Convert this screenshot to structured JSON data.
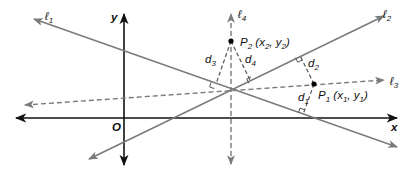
{
  "diagram": {
    "colors": {
      "axis": "#111111",
      "line": "#7a7a7a",
      "point": "#000000",
      "background": "#ffffff"
    },
    "axes": {
      "x_label": "x",
      "y_label": "y",
      "origin_label": "O"
    },
    "lines": [
      {
        "id": "l1",
        "label": "ℓ",
        "sub": "1",
        "style": "solid"
      },
      {
        "id": "l2",
        "label": "ℓ",
        "sub": "2",
        "style": "solid"
      },
      {
        "id": "l3",
        "label": "ℓ",
        "sub": "3",
        "style": "dashed"
      },
      {
        "id": "l4",
        "label": "ℓ",
        "sub": "4",
        "style": "dashed"
      }
    ],
    "points": [
      {
        "id": "P1",
        "name": "P",
        "sub": "1",
        "coords_open": " (x",
        "x_sub": "1",
        "mid": ", y",
        "y_sub": "1",
        "close": ")"
      },
      {
        "id": "P2",
        "name": "P",
        "sub": "2",
        "coords_open": " (x",
        "x_sub": "2",
        "mid": ", y",
        "y_sub": "2",
        "close": ")"
      }
    ],
    "distances": [
      {
        "id": "d1",
        "label": "d",
        "sub": "1"
      },
      {
        "id": "d2",
        "label": "d",
        "sub": "2"
      },
      {
        "id": "d3",
        "label": "d",
        "sub": "3"
      },
      {
        "id": "d4",
        "label": "d",
        "sub": "4"
      }
    ]
  }
}
